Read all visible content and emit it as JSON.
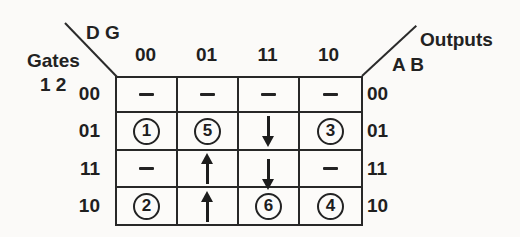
{
  "figure": {
    "top_left_axis_label": "D G",
    "left_axis_title": "Gates",
    "left_axis_sub": "1 2",
    "right_axis_title": "Outputs",
    "right_axis_sub": "A B",
    "column_headers": [
      "00",
      "01",
      "11",
      "10"
    ],
    "row_labels_left": [
      "00",
      "01",
      "11",
      "10"
    ],
    "row_labels_right": [
      "00",
      "01",
      "11",
      "10"
    ],
    "colors": {
      "ink": "#1f1f1f",
      "paper": "#fbfaf8"
    }
  },
  "grid": {
    "rows": [
      [
        {
          "type": "dash"
        },
        {
          "type": "dash"
        },
        {
          "type": "dash"
        },
        {
          "type": "dash"
        }
      ],
      [
        {
          "type": "circle",
          "value": "1"
        },
        {
          "type": "circle",
          "value": "5"
        },
        {
          "type": "arrow",
          "dir": "down"
        },
        {
          "type": "circle",
          "value": "3"
        }
      ],
      [
        {
          "type": "dash"
        },
        {
          "type": "arrow",
          "dir": "up"
        },
        {
          "type": "arrow",
          "dir": "down",
          "dy": 6
        },
        {
          "type": "dash"
        }
      ],
      [
        {
          "type": "circle",
          "value": "2"
        },
        {
          "type": "arrow",
          "dir": "up"
        },
        {
          "type": "circle",
          "value": "6"
        },
        {
          "type": "circle",
          "value": "4"
        }
      ]
    ]
  }
}
